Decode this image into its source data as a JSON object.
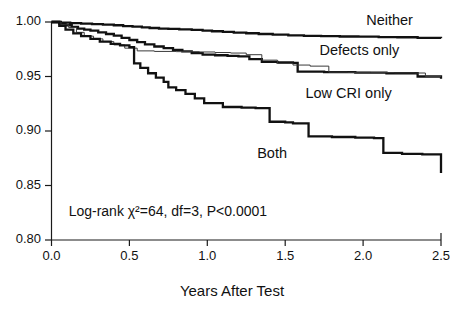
{
  "chart_data": {
    "type": "line",
    "title": "",
    "subtitle": "",
    "xlabel": "Years After Test",
    "ylabel": "",
    "xlim": [
      0.0,
      2.5
    ],
    "ylim": [
      0.8,
      1.0
    ],
    "grid": false,
    "legend_position": "inline-right-of-curves",
    "xticks": [
      "0.0",
      "0.5",
      "1.0",
      "1.5",
      "2.0",
      "2.5"
    ],
    "xtick_values": [
      0.0,
      0.5,
      1.0,
      1.5,
      2.0,
      2.5
    ],
    "yticks": [
      "1.00",
      "0.95",
      "0.90",
      "0.85",
      "0.80"
    ],
    "ytick_values": [
      1.0,
      0.95,
      0.9,
      0.85,
      0.8
    ],
    "annotations": [
      {
        "name": "log-rank-statistic",
        "text": "Log-rank χ²=64, df=3, P<0.0001",
        "x": 0.11,
        "y": 0.825
      }
    ],
    "series": [
      {
        "name": "Neither",
        "style": "bold",
        "label_x": 2.02,
        "label_y": 1.0005,
        "x": [
          0.0,
          0.06,
          0.12,
          0.19,
          0.26,
          0.33,
          0.4,
          0.46,
          0.52,
          0.58,
          0.63,
          0.69,
          0.75,
          0.82,
          0.9,
          0.97,
          1.03,
          1.1,
          1.17,
          1.25,
          1.33,
          1.42,
          1.52,
          1.62,
          1.73,
          1.85,
          1.97,
          2.1,
          2.22,
          2.35,
          2.5
        ],
        "y": [
          1.0,
          0.9995,
          0.999,
          0.9985,
          0.998,
          0.9975,
          0.997,
          0.9963,
          0.9957,
          0.995,
          0.9945,
          0.994,
          0.9937,
          0.9933,
          0.9928,
          0.992,
          0.9915,
          0.991,
          0.9903,
          0.9897,
          0.989,
          0.9885,
          0.9878,
          0.9873,
          0.987,
          0.9867,
          0.9865,
          0.9862,
          0.986,
          0.9855,
          0.9852
        ]
      },
      {
        "name": "Defects only",
        "style": "bold",
        "label_x": 1.72,
        "label_y": 0.9735,
        "x": [
          0.0,
          0.05,
          0.09,
          0.13,
          0.17,
          0.21,
          0.25,
          0.3,
          0.35,
          0.4,
          0.45,
          0.5,
          0.55,
          0.6,
          0.66,
          0.72,
          0.78,
          0.84,
          0.9,
          0.97,
          1.05,
          1.13,
          1.2,
          1.27,
          1.35,
          1.45,
          1.55,
          1.58,
          1.75,
          1.95,
          2.15,
          2.35,
          2.5
        ],
        "y": [
          1.0,
          0.9985,
          0.997,
          0.9955,
          0.994,
          0.993,
          0.992,
          0.9905,
          0.989,
          0.9875,
          0.9855,
          0.9835,
          0.9815,
          0.9795,
          0.9775,
          0.976,
          0.9745,
          0.973,
          0.9715,
          0.97,
          0.9695,
          0.969,
          0.9685,
          0.966,
          0.9635,
          0.963,
          0.9625,
          0.9545,
          0.954,
          0.9535,
          0.953,
          0.95,
          0.948
        ]
      },
      {
        "name": "Low CRI only",
        "style": "thin",
        "label_x": 1.63,
        "label_y": 0.9335,
        "x": [
          0.0,
          0.06,
          0.11,
          0.16,
          0.21,
          0.27,
          0.33,
          0.4,
          0.47,
          0.55,
          0.66,
          0.8,
          0.95,
          1.05,
          1.15,
          1.25,
          1.35,
          1.45,
          1.55,
          1.66,
          1.78,
          1.9,
          2.05,
          2.2,
          2.33,
          2.4,
          2.5
        ],
        "y": [
          1.0,
          0.9975,
          0.995,
          0.9905,
          0.987,
          0.9845,
          0.982,
          0.979,
          0.976,
          0.9735,
          0.973,
          0.9728,
          0.9725,
          0.972,
          0.9715,
          0.97,
          0.965,
          0.962,
          0.9605,
          0.9595,
          0.954,
          0.9538,
          0.9536,
          0.9534,
          0.9532,
          0.95,
          0.9498
        ]
      },
      {
        "name": "Both",
        "style": "bold",
        "label_x": 1.32,
        "label_y": 0.879,
        "x": [
          0.0,
          0.05,
          0.09,
          0.14,
          0.19,
          0.25,
          0.31,
          0.38,
          0.44,
          0.5,
          0.53,
          0.57,
          0.62,
          0.67,
          0.72,
          0.75,
          0.8,
          0.86,
          0.92,
          0.98,
          1.1,
          1.22,
          1.31,
          1.4,
          1.5,
          1.55,
          1.65,
          1.8,
          1.95,
          2.07,
          2.13,
          2.25,
          2.38,
          2.5
        ],
        "y": [
          1.0,
          0.9965,
          0.993,
          0.9895,
          0.987,
          0.9845,
          0.982,
          0.98,
          0.9785,
          0.977,
          0.962,
          0.958,
          0.953,
          0.949,
          0.945,
          0.94,
          0.9375,
          0.934,
          0.93,
          0.9255,
          0.922,
          0.9215,
          0.921,
          0.9085,
          0.908,
          0.907,
          0.895,
          0.8945,
          0.894,
          0.8935,
          0.88,
          0.879,
          0.8785,
          0.8615
        ]
      }
    ]
  },
  "labels": {
    "neither": "Neither",
    "defects_only": "Defects only",
    "low_cri_only": "Low CRI only",
    "both": "Both",
    "logrank": "Log-rank χ²=64, df=3, P<0.0001",
    "x_axis_title": "Years After Test"
  },
  "ticks": {
    "y": [
      "1.00",
      "0.95",
      "0.90",
      "0.85",
      "0.80"
    ],
    "x": [
      "0.0",
      "0.5",
      "1.0",
      "1.5",
      "2.0",
      "2.5"
    ]
  },
  "colors": {
    "ink": "#111111",
    "thin_line": "#3a3a3a",
    "background": "#ffffff"
  }
}
